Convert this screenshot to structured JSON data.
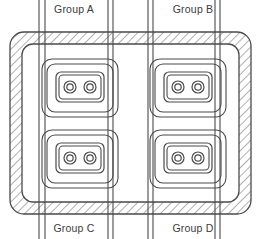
{
  "diagram": {
    "background_color": "#ffffff",
    "stroke_color": "#4a4a4a",
    "hatch_color": "#6e6e6e",
    "label_color": "#3b3b3b",
    "enclosure": {
      "name": "hatched-wall-enclosure",
      "outer": {
        "x": 10,
        "y": 32,
        "width": 241,
        "height": 182,
        "radius": 14
      },
      "inner": {
        "x": 22,
        "y": 44,
        "width": 217,
        "height": 158,
        "radius": 11
      },
      "fill_pattern": "diagonal-hatch"
    },
    "labels": [
      {
        "id": "group-a",
        "text": "Group A",
        "x": 74,
        "y": 13,
        "position": "top-left"
      },
      {
        "id": "group-b",
        "text": "Group B",
        "x": 193,
        "y": 13,
        "position": "top-right"
      },
      {
        "id": "group-c",
        "text": "Group C",
        "x": 74,
        "y": 232,
        "position": "bottom-left"
      },
      {
        "id": "group-d",
        "text": "Group D",
        "x": 193,
        "y": 232,
        "position": "bottom-right"
      }
    ],
    "conduit_line_pairs": [
      {
        "id": "conduit-pair-1",
        "x_left": 39,
        "x_right": 45,
        "y_top": 0,
        "y_bottom": 239
      },
      {
        "id": "conduit-pair-2",
        "x_left": 108,
        "x_right": 113,
        "y_top": 0,
        "y_bottom": 239
      },
      {
        "id": "conduit-pair-3",
        "x_left": 148,
        "x_right": 153,
        "y_top": 0,
        "y_bottom": 239
      },
      {
        "id": "conduit-pair-4",
        "x_left": 215,
        "x_right": 220,
        "y_top": 0,
        "y_bottom": 239
      }
    ],
    "receptacles": [
      {
        "id": "receptacle-group-a",
        "group": "Group A",
        "outer_box": {
          "x": 42,
          "y": 59,
          "width": 76,
          "height": 58,
          "radius": 10
        },
        "middle_box": {
          "x": 47,
          "y": 64,
          "width": 66,
          "height": 48,
          "radius": 8
        },
        "plate": {
          "x": 56,
          "y": 72,
          "width": 48,
          "height": 30,
          "radius": 5
        },
        "plate_inner": {
          "x": 59,
          "y": 75,
          "width": 42,
          "height": 24,
          "radius": 4
        },
        "outlets": [
          {
            "id": "outlet-a-1",
            "cx": 70,
            "cy": 87,
            "r_outer": 6,
            "r_inner": 3.2
          },
          {
            "id": "outlet-a-2",
            "cx": 90,
            "cy": 87,
            "r_outer": 6,
            "r_inner": 3.2
          }
        ]
      },
      {
        "id": "receptacle-group-b",
        "group": "Group B",
        "outer_box": {
          "x": 150,
          "y": 59,
          "width": 76,
          "height": 58,
          "radius": 10
        },
        "middle_box": {
          "x": 155,
          "y": 64,
          "width": 66,
          "height": 48,
          "radius": 8
        },
        "plate": {
          "x": 164,
          "y": 72,
          "width": 48,
          "height": 30,
          "radius": 5
        },
        "plate_inner": {
          "x": 167,
          "y": 75,
          "width": 42,
          "height": 24,
          "radius": 4
        },
        "outlets": [
          {
            "id": "outlet-b-1",
            "cx": 178,
            "cy": 87,
            "r_outer": 6,
            "r_inner": 3.2
          },
          {
            "id": "outlet-b-2",
            "cx": 198,
            "cy": 87,
            "r_outer": 6,
            "r_inner": 3.2
          }
        ]
      },
      {
        "id": "receptacle-group-c",
        "group": "Group C",
        "outer_box": {
          "x": 42,
          "y": 130,
          "width": 76,
          "height": 58,
          "radius": 10
        },
        "middle_box": {
          "x": 47,
          "y": 135,
          "width": 66,
          "height": 48,
          "radius": 8
        },
        "plate": {
          "x": 56,
          "y": 143,
          "width": 48,
          "height": 30,
          "radius": 5
        },
        "plate_inner": {
          "x": 59,
          "y": 146,
          "width": 42,
          "height": 24,
          "radius": 4
        },
        "outlets": [
          {
            "id": "outlet-c-1",
            "cx": 70,
            "cy": 158,
            "r_outer": 6,
            "r_inner": 3.2
          },
          {
            "id": "outlet-c-2",
            "cx": 90,
            "cy": 158,
            "r_outer": 6,
            "r_inner": 3.2
          }
        ]
      },
      {
        "id": "receptacle-group-d",
        "group": "Group D",
        "outer_box": {
          "x": 150,
          "y": 130,
          "width": 76,
          "height": 58,
          "radius": 10
        },
        "middle_box": {
          "x": 155,
          "y": 135,
          "width": 66,
          "height": 48,
          "radius": 8
        },
        "plate": {
          "x": 164,
          "y": 143,
          "width": 48,
          "height": 30,
          "radius": 5
        },
        "plate_inner": {
          "x": 167,
          "y": 146,
          "width": 42,
          "height": 24,
          "radius": 4
        },
        "outlets": [
          {
            "id": "outlet-d-1",
            "cx": 178,
            "cy": 158,
            "r_outer": 6,
            "r_inner": 3.2
          },
          {
            "id": "outlet-d-2",
            "cx": 198,
            "cy": 158,
            "r_outer": 6,
            "r_inner": 3.2
          }
        ]
      }
    ]
  }
}
